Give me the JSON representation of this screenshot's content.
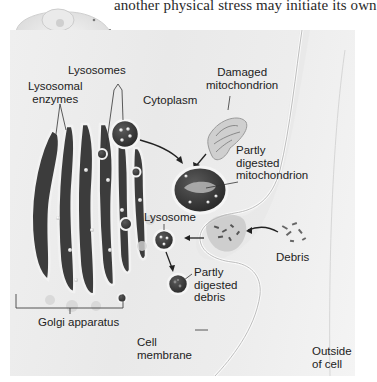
{
  "caption": {
    "text": "another physical stress may initiate its own"
  },
  "thumbnail": {
    "icon": "cell-thumbnail-icon"
  },
  "diagram": {
    "labels": {
      "lysosomes": "Lysosomes",
      "lysosomal_enzymes_1": "Lysosomal",
      "lysosomal_enzymes_2": "enzymes",
      "cytoplasm": "Cytoplasm",
      "damaged_mito_1": "Damaged",
      "damaged_mito_2": "mitochondrion",
      "partly_digested_mito_1": "Partly",
      "partly_digested_mito_2": "digested",
      "partly_digested_mito_3": "mitochondrion",
      "lysosome": "Lysosome",
      "debris": "Debris",
      "partly_digested_debris_1": "Partly",
      "partly_digested_debris_2": "digested",
      "partly_digested_debris_3": "debris",
      "golgi": "Golgi apparatus",
      "cell_membrane_1": "Cell",
      "cell_membrane_2": "membrane",
      "outside_cell_1": "Outside",
      "outside_cell_2": "of cell"
    },
    "colors": {
      "background": "#ececec",
      "organelle_dark": "#3a3a3a",
      "membrane_light": "#f7f7f7",
      "text": "#222222"
    }
  }
}
